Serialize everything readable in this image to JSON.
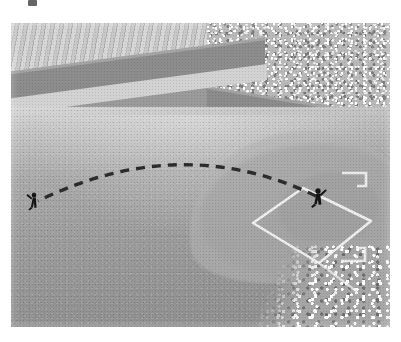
{
  "scene": {
    "title": "Baseball stadium aerial view with ball trajectory",
    "wall_distance_marker": "330",
    "figures": [
      {
        "name": "batter",
        "label": "batter at home plate",
        "x": 318,
        "y": 196
      },
      {
        "name": "outfielder",
        "label": "left fielder",
        "x": 34,
        "y": 200
      }
    ],
    "trajectory": {
      "style": "dashed",
      "color": "#2b2b2b",
      "start": {
        "x": 316,
        "y": 193
      },
      "apex": {
        "x": 168,
        "y": 152
      },
      "end": {
        "x": 38,
        "y": 200
      }
    },
    "colors": {
      "wall": "#8c8c8c",
      "grass": "#a8a8a8",
      "infield_dirt": "#b4b4b4",
      "field_lines": "#f2f2f2",
      "marker_text": "#f4f4f4",
      "bleachers": "#c9c9c9",
      "crowd": "#b9b9b9",
      "figure": "#1a1a1a",
      "page_background": "#ffffff"
    },
    "regions": [
      {
        "name": "bleachers-upper-left",
        "label": "empty striped bleachers"
      },
      {
        "name": "crowd-right",
        "label": "packed crowd section"
      },
      {
        "name": "outfield-wall",
        "label": "outfield wall"
      },
      {
        "name": "warning-track",
        "label": "warning track"
      },
      {
        "name": "outfield-grass",
        "label": "outfield grass"
      },
      {
        "name": "infield-dirt",
        "label": "infield dirt arc"
      },
      {
        "name": "infield-diamond",
        "label": "infield base lines"
      },
      {
        "name": "crowd-bottom-right",
        "label": "stands behind home plate"
      }
    ]
  }
}
